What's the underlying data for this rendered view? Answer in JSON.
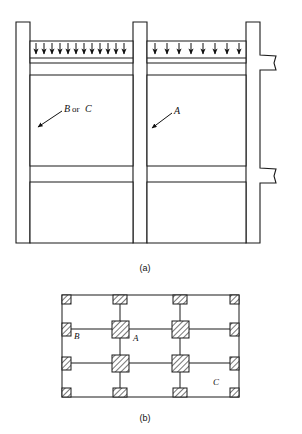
{
  "figure": {
    "panels": [
      {
        "id": "a",
        "caption": "(a)",
        "type": "section-elevation"
      },
      {
        "id": "b",
        "caption": "(b)",
        "type": "column-grid-plan"
      }
    ]
  },
  "panel_a": {
    "caption": "(a)",
    "labels": {
      "left_bay": "B or C",
      "left_bay_italic_1": "B",
      "left_bay_conjunction": "or",
      "left_bay_italic_2": "C",
      "right_bay": "A"
    },
    "loads": [
      {
        "bay": "left",
        "arrow_count": 12,
        "direction": "down",
        "type": "uniformly-distributed-load"
      },
      {
        "bay": "right",
        "arrow_count": 8,
        "direction": "down",
        "type": "uniformly-distributed-load"
      }
    ],
    "members": {
      "columns": 3,
      "beam_levels": 2,
      "right_column_stubs": 2
    }
  },
  "panel_b": {
    "caption": "(b)",
    "grid": {
      "columns": 4,
      "rows": 4
    },
    "labels": {
      "edge_column": "B",
      "interior_column": "A",
      "corner_column": "C"
    },
    "column_types": [
      {
        "name": "corner-column",
        "size": "small"
      },
      {
        "name": "edge-column",
        "size": "small"
      },
      {
        "name": "interior-column",
        "size": "large"
      }
    ]
  },
  "style": {
    "line_color": "#1a1a1a",
    "background": "#ffffff",
    "hatch_color": "#2b2b2b"
  }
}
